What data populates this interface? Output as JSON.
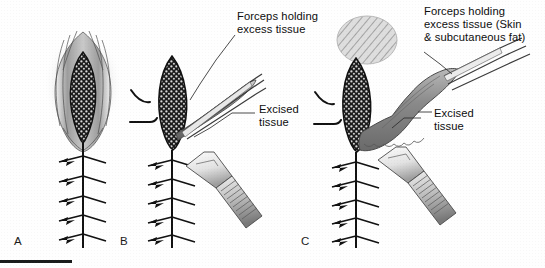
{
  "figure": {
    "background_color": "#fefefe",
    "ink_color": "#111111",
    "tissue_dark_color": "#1d1d1d",
    "tissue_gray_color": "#8c8c8c",
    "skin_gray_color": "#b5b5b5"
  },
  "labels": {
    "b_forceps": "Forceps holding\nexcess tissue",
    "b_excised": "Excised\ntissue",
    "c_forceps": "Forceps holding\nexcess tissue (Skin\n& subcutaneous fat)",
    "c_excised": "Excised\ntissue"
  },
  "panels": [
    {
      "id": "A",
      "letter": "A",
      "caption": "A",
      "x": 18,
      "y": 241,
      "contents": [
        "open-elliptical-wound",
        "granulation-tissue",
        "suture-line"
      ]
    },
    {
      "id": "B",
      "letter": "B",
      "caption": "B",
      "x": 122,
      "y": 241,
      "contents": [
        "granulation-tissue",
        "forceps",
        "excised-tissue-strip",
        "scalpel",
        "suture-line"
      ]
    },
    {
      "id": "C",
      "letter": "C",
      "caption": "C",
      "x": 303,
      "y": 241,
      "contents": [
        "hatched-skin-region",
        "granulation-tissue",
        "forceps",
        "excised-tissue-slab",
        "scalpel",
        "suture-line"
      ]
    }
  ],
  "scale_bar": {
    "x": 0,
    "y": 261,
    "width": 72,
    "height": 3,
    "color": "#1a1a1a"
  },
  "suture": {
    "stitch_count": 5,
    "description": "vertical suture line with cross stitches"
  }
}
